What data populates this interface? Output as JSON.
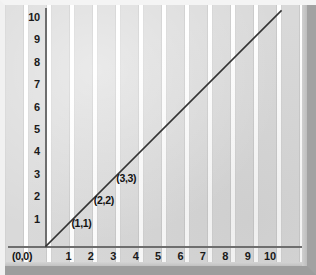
{
  "chart_data": {
    "type": "line",
    "title": "",
    "subtitle": "",
    "xlabel": "",
    "ylabel": "",
    "xlim": [
      0,
      12
    ],
    "ylim": [
      0,
      12
    ],
    "grid": true,
    "legend": "none",
    "x_tick_labels": [
      "1",
      "2",
      "3",
      "4",
      "5",
      "6",
      "7",
      "8",
      "9",
      "10"
    ],
    "y_tick_labels": [
      "1",
      "2",
      "3",
      "4",
      "5",
      "6",
      "7",
      "8",
      "9",
      "10",
      "11"
    ],
    "x_ticks": [
      1,
      2,
      3,
      4,
      5,
      6,
      7,
      8,
      9,
      10
    ],
    "y_ticks": [
      1,
      2,
      3,
      4,
      5,
      6,
      7,
      8,
      9,
      10,
      11
    ],
    "origin_label": "(0,0)",
    "series": [
      {
        "name": "y = x",
        "type": "line",
        "color": "#333333",
        "x": [
          0,
          12
        ],
        "y": [
          0,
          12
        ]
      }
    ],
    "annotations": [
      {
        "label": "(1,1)",
        "x": 1,
        "y": 1
      },
      {
        "label": "(2,2)",
        "x": 2,
        "y": 2
      },
      {
        "label": "(3,3)",
        "x": 3,
        "y": 3
      }
    ],
    "colors": {
      "line": "#333333",
      "axis": "#6e6e6e",
      "grid_cell": "#d9d9d9",
      "grid_gap": "#ffffff",
      "text": "#121212",
      "frame": "#bdbdbd"
    }
  }
}
